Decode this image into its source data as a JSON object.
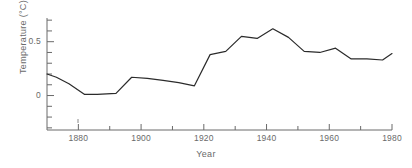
{
  "chart_data": {
    "type": "line",
    "title": "",
    "xlabel": "Year",
    "ylabel": "Temperature (°C)",
    "xlim": [
      1870,
      1980
    ],
    "ylim": [
      -0.32,
      0.72
    ],
    "grid": false,
    "legend": null,
    "line_color": "#2b2b2b",
    "axis_color": "#6a6a6a",
    "background": "#ffffff",
    "x_major_ticks": [
      1880,
      1900,
      1920,
      1940,
      1960,
      1980
    ],
    "x_major_tick_labels": [
      "1880",
      "1900",
      "1920",
      "1940",
      "1960",
      "1980"
    ],
    "x_minor_ticks": [
      1890,
      1910,
      1930,
      1950,
      1970
    ],
    "y_major_ticks": [
      0,
      0.5
    ],
    "y_major_tick_labels": [
      "0",
      "0.5"
    ],
    "y_minor_ticks": [
      -0.3,
      -0.2,
      -0.1,
      0.1,
      0.2,
      0.3,
      0.4,
      0.6,
      0.7
    ],
    "series": [
      {
        "name": "Global mean temperature anomaly",
        "x": [
          1870,
          1873,
          1877,
          1882,
          1886,
          1892,
          1897,
          1902,
          1907,
          1912,
          1917,
          1922,
          1927,
          1932,
          1937,
          1942,
          1947,
          1952,
          1957,
          1962,
          1967,
          1972,
          1977,
          1980
        ],
        "y": [
          0.2,
          0.17,
          0.11,
          0.01,
          0.01,
          0.02,
          0.17,
          0.16,
          0.14,
          0.12,
          0.09,
          0.38,
          0.41,
          0.55,
          0.53,
          0.62,
          0.54,
          0.41,
          0.4,
          0.44,
          0.34,
          0.34,
          0.33,
          0.39
        ]
      }
    ]
  },
  "axes": {
    "y_title": "Temperature (°C)",
    "x_title": "Year",
    "y_labels": [
      "0.5",
      "0"
    ],
    "x_labels": [
      "1880",
      "1900",
      "1920",
      "1940",
      "1960",
      "1980"
    ]
  }
}
